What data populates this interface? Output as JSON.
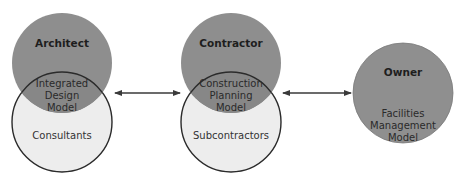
{
  "diagram": {
    "colors": {
      "top_circle_fill": "#8e8e8e",
      "overlap_fill": "#878787",
      "bottom_circle_fill": "#ededed",
      "outline": "#2b2b2b",
      "arrow": "#3a3a3a",
      "owner_fill": "#8f8f8f"
    },
    "groups": [
      {
        "top_label": "Architect",
        "overlap_lines": [
          "Integrated",
          "Design",
          "Model"
        ],
        "bottom_label": "Consultants"
      },
      {
        "top_label": "Contractor",
        "overlap_lines": [
          "Construction",
          "Planning",
          "Model"
        ],
        "bottom_label": "Subcontractors"
      },
      {
        "top_label": "Owner",
        "body_lines": [
          "Facilities",
          "Management",
          "Model"
        ]
      }
    ],
    "connectors": [
      {
        "from": "Integrated Design Model",
        "to": "Construction Planning Model",
        "type": "double-arrow"
      },
      {
        "from": "Construction Planning Model",
        "to": "Facilities Management Model",
        "type": "double-arrow"
      }
    ]
  }
}
